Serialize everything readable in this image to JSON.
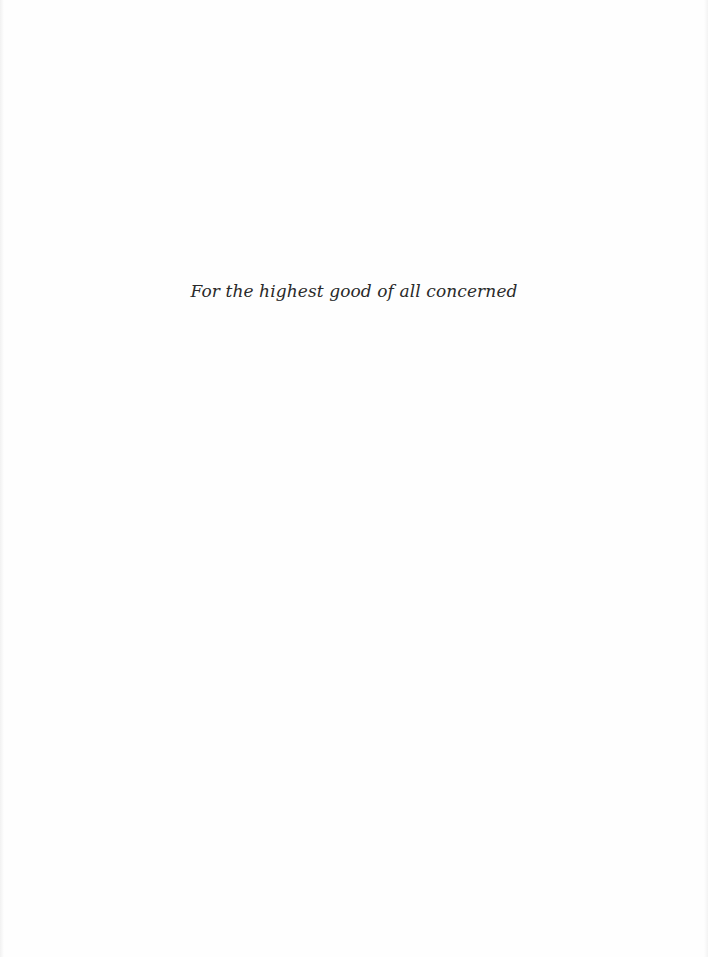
{
  "page": {
    "type": "dedication",
    "background_color": "#fefefe",
    "text_color": "#2a2a2a"
  },
  "dedication": {
    "text": "For the highest good of all concerned"
  }
}
